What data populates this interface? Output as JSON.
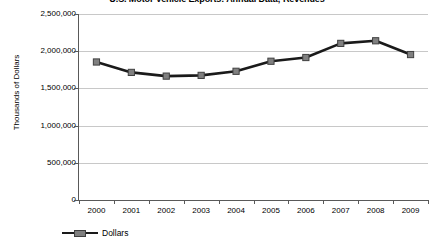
{
  "chart_data": {
    "type": "line",
    "title": "U.S. Motor Vehicle Exports: Annual Data; Revenues",
    "xlabel": "",
    "ylabel": "Thousands of Dollars",
    "categories": [
      "2000",
      "2001",
      "2002",
      "2003",
      "2004",
      "2005",
      "2006",
      "2007",
      "2008",
      "2009"
    ],
    "series": [
      {
        "name": "Dollars",
        "values": [
          1855000,
          1715000,
          1665000,
          1675000,
          1730000,
          1865000,
          1915000,
          2105000,
          2140000,
          1955000
        ]
      }
    ],
    "ylim": [
      0,
      2500000
    ],
    "ytick_labels": [
      "2,500,000",
      "2,000,000",
      "1,500,000",
      "1,000,000",
      "500,000",
      "0"
    ],
    "ytick_values": [
      2500000,
      2000000,
      1500000,
      1000000,
      500000,
      0
    ],
    "grid": true,
    "legend_position": "bottom-left",
    "line_color": "#1a1a1a",
    "marker_color": "#808080",
    "marker_edge_color": "#404040",
    "grid_color": "#c8c8c8",
    "axis_color": "#595959"
  },
  "legend": {
    "entries": [
      {
        "label": "Dollars"
      }
    ]
  }
}
